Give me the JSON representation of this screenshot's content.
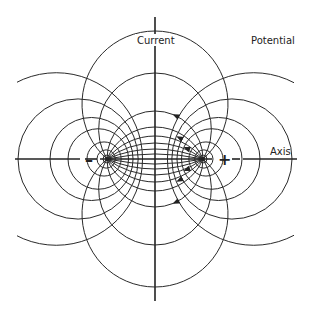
{
  "diagram": {
    "labels": {
      "current": "Current",
      "potential": "Potential",
      "axis": "Axis",
      "negative": "–",
      "positive": "+"
    },
    "electrodes": [
      {
        "name": "negative-electrode",
        "polarity": "negative"
      },
      {
        "name": "positive-electrode",
        "polarity": "positive"
      }
    ],
    "current_lines": {
      "count_per_side": 8,
      "arrowed_lines": 3,
      "direction": "from positive to negative electrode"
    },
    "potential_lines": {
      "count_per_electrode": 7
    },
    "colors": {
      "ink": "#2a2a2a",
      "background": "#ffffff"
    }
  }
}
